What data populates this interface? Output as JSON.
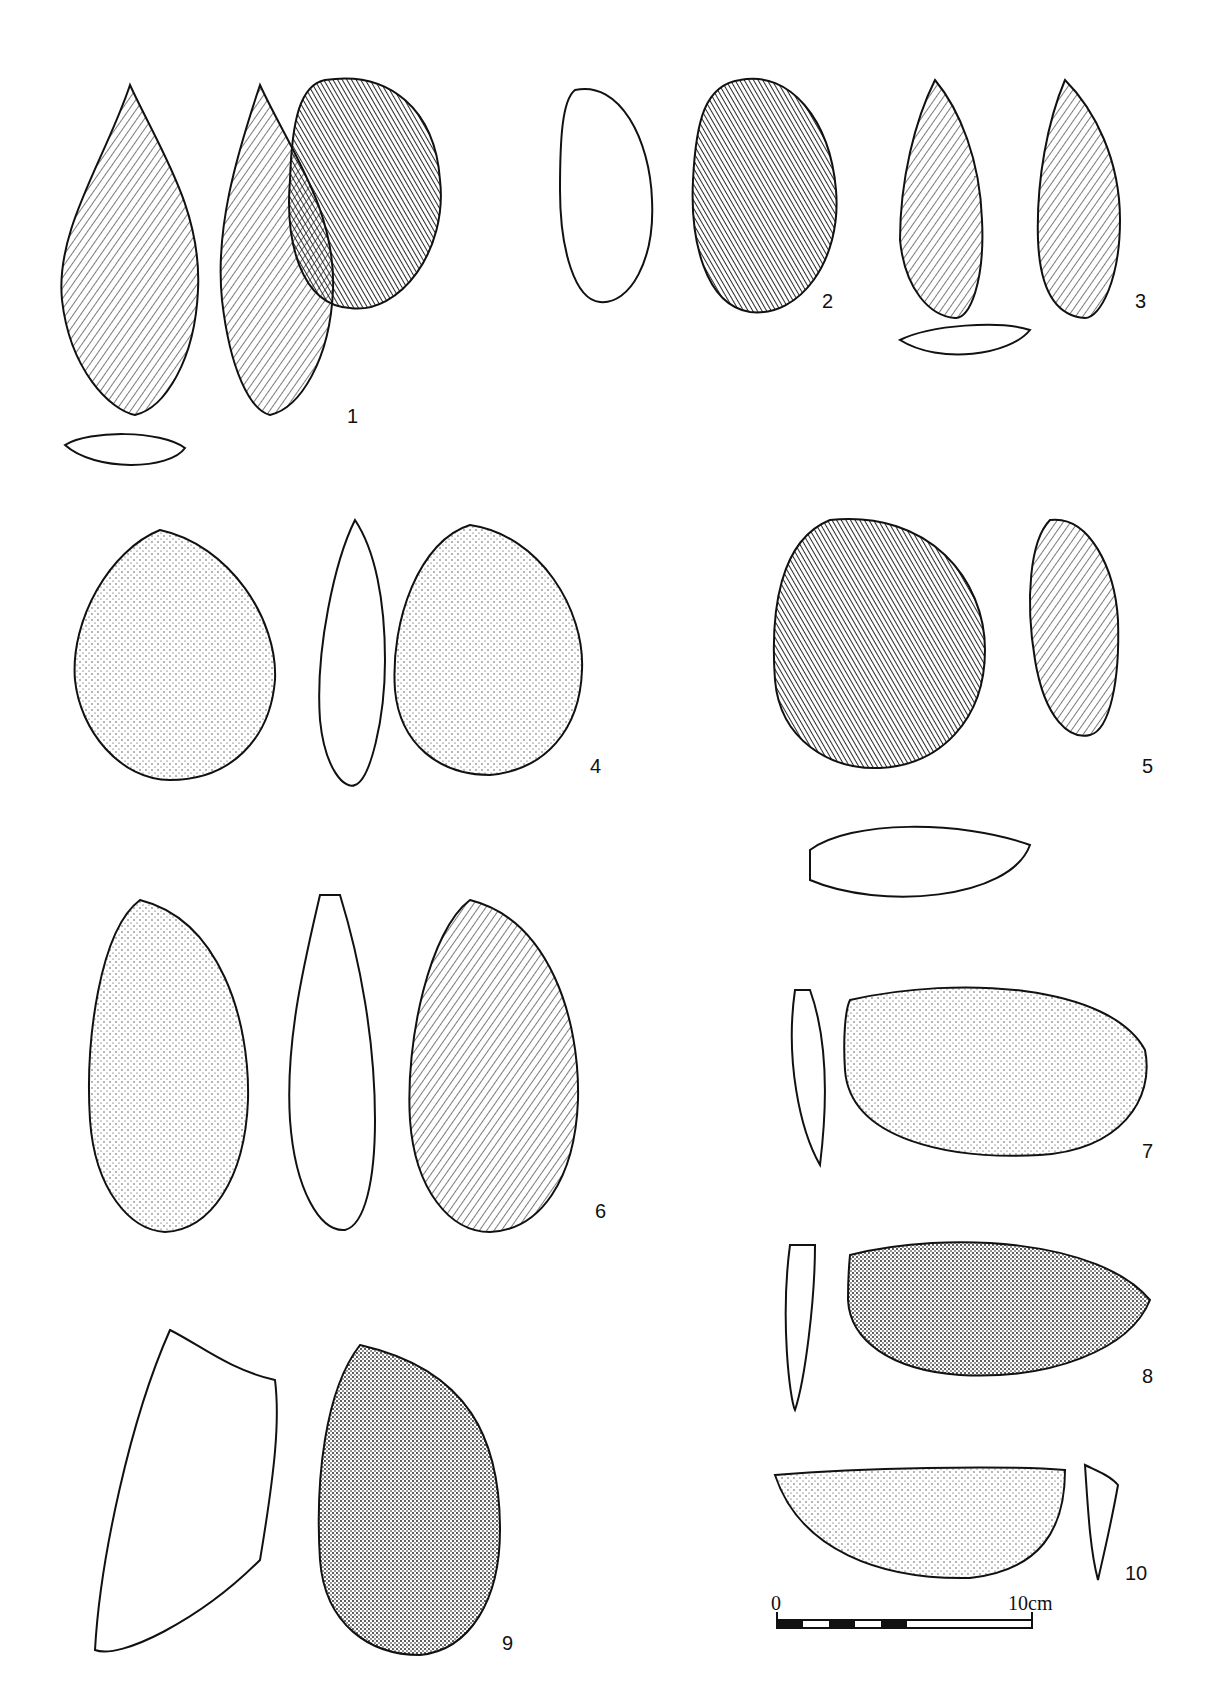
{
  "figure": {
    "type": "archaeological stone tool plate",
    "items": [
      {
        "id": "1",
        "label": "1",
        "views": 3
      },
      {
        "id": "2",
        "label": "2",
        "views": 3
      },
      {
        "id": "3",
        "label": "3",
        "views": 3
      },
      {
        "id": "4",
        "label": "4",
        "views": 3
      },
      {
        "id": "5",
        "label": "5",
        "views": 3
      },
      {
        "id": "6",
        "label": "6",
        "views": 3
      },
      {
        "id": "7",
        "label": "7",
        "views": 2
      },
      {
        "id": "8",
        "label": "8",
        "views": 2
      },
      {
        "id": "9",
        "label": "9",
        "views": 2
      },
      {
        "id": "10",
        "label": "10",
        "views": 2
      }
    ],
    "scale_bar": {
      "start": "0",
      "end": "10",
      "unit": "cm"
    }
  }
}
